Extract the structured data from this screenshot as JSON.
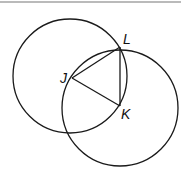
{
  "diagram": {
    "points": {
      "J": {
        "label": "J",
        "x": 72,
        "y": 78
      },
      "K": {
        "label": "K",
        "x": 120,
        "y": 106
      },
      "L": {
        "label": "L",
        "x": 120,
        "y": 47
      }
    },
    "circles": [
      {
        "name": "circle-centered-J",
        "cx": 70,
        "cy": 76,
        "r": 57
      },
      {
        "name": "circle-centered-K",
        "cx": 120,
        "cy": 108,
        "r": 58
      }
    ],
    "segments": [
      "JL",
      "JK",
      "LK"
    ],
    "stroke_color": "#1a1a1a"
  }
}
